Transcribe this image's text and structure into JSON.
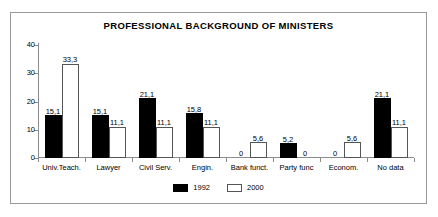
{
  "chart_data": {
    "type": "bar",
    "title": "PROFESSIONAL BACKGROUND OF MINISTERS",
    "xlabel": "",
    "ylabel": "",
    "ylim": [
      0,
      40
    ],
    "yticks": [
      "0",
      "10",
      "20",
      "30",
      "40"
    ],
    "ytick_values": [
      0,
      10,
      20,
      30,
      40
    ],
    "grid": false,
    "legend_position": "bottom-center",
    "decimal_separator": ",",
    "categories": [
      "Univ.Teach.",
      "Lawyer",
      "Civil Serv.",
      "Engin.",
      "Bank funct.",
      "Party func",
      "Econom.",
      "No data"
    ],
    "series": [
      {
        "name": "1992",
        "color": "#000000",
        "values": [
          15.1,
          15.1,
          21.1,
          15.8,
          0,
          5.2,
          0,
          21.1
        ],
        "labels": [
          "15,1",
          "15,1",
          "21,1",
          "15,8",
          "0",
          "5,2",
          "0",
          "21,1"
        ]
      },
      {
        "name": "2000",
        "color": "#ffffff",
        "values": [
          33.3,
          11.1,
          11.1,
          11.1,
          5.6,
          0,
          5.6,
          11.1
        ],
        "labels": [
          "33,3",
          "11,1",
          "11,1",
          "11,1",
          "5,6",
          "0",
          "5,6",
          "11,1"
        ]
      }
    ]
  },
  "legend": {
    "items": [
      {
        "label": "1992"
      },
      {
        "label": "2000"
      }
    ]
  }
}
